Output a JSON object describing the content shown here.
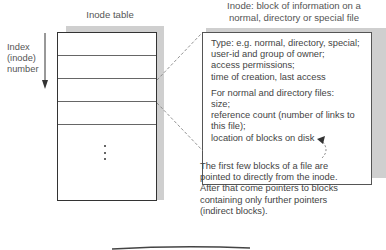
{
  "inode_table": {
    "title": "Inode table",
    "index_label_lines": [
      "Index",
      "(inode)",
      "number"
    ],
    "rows": 5,
    "ellipsis": "⋮"
  },
  "inode": {
    "title_lines": [
      "Inode: block of information on a",
      "normal, directory or special file"
    ],
    "section1_lines": [
      "Type: e.g. normal, directory, special;",
      "user-id and group of owner;",
      "access permissions;",
      "time of creation, last access"
    ],
    "section2_lines": [
      "For normal and directory files:",
      "size;",
      "reference count (number of links to",
      "this file);",
      "location of blocks on disk"
    ]
  },
  "annotation": {
    "lines": [
      "The first few blocks of a file are",
      "pointed to directly from the inode.",
      "After that come pointers to blocks",
      "containing only further pointers",
      "(indirect blocks)."
    ]
  },
  "colors": {
    "shadow": "#cfcfcf",
    "border": "#333333",
    "text": "#444444"
  }
}
